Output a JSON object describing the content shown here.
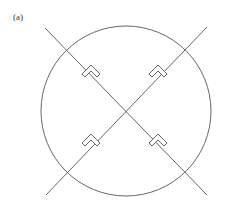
{
  "figure": {
    "label": "(a)",
    "stroke_color": "#666666",
    "circle": {
      "cx": 126,
      "cy": 111,
      "r": 85
    },
    "lines": [
      {
        "x1": 45,
        "y1": 28,
        "x2": 207,
        "y2": 195
      },
      {
        "x1": 207,
        "y1": 27,
        "x2": 46,
        "y2": 195
      }
    ],
    "markers": [
      {
        "x": 91,
        "y": 74,
        "rot": 0
      },
      {
        "x": 158,
        "y": 74,
        "rot": 0
      },
      {
        "x": 91,
        "y": 143,
        "rot": 0
      },
      {
        "x": 158,
        "y": 143,
        "rot": 0
      }
    ]
  }
}
